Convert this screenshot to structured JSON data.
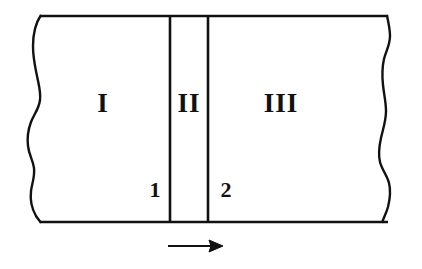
{
  "figure": {
    "type": "schematic-diagram",
    "background_color": "#ffffff",
    "line_color": "#111111",
    "regions": [
      {
        "id": "region-1",
        "label": "I",
        "center_x": 103,
        "center_y": 105
      },
      {
        "id": "region-2",
        "label": "II",
        "center_x": 189,
        "center_y": 105
      },
      {
        "id": "region-3",
        "label": "III",
        "center_x": 281,
        "center_y": 105
      }
    ],
    "interfaces": [
      {
        "id": "interface-1",
        "label": "1",
        "line_x": 170,
        "label_x": 155,
        "label_y": 192
      },
      {
        "id": "interface-2",
        "label": "2",
        "line_x": 208,
        "label_x": 226,
        "label_y": 192
      }
    ],
    "arrow": {
      "name": "direction-arrow",
      "direction": "right",
      "start_x": 168,
      "end_x": 223,
      "y": 246
    },
    "boundaries": {
      "top_y": 16,
      "bottom_y": 222,
      "left_x": 40,
      "right_x": 388,
      "left_edge_style": "wavy-break",
      "right_edge_style": "wavy-break"
    }
  }
}
